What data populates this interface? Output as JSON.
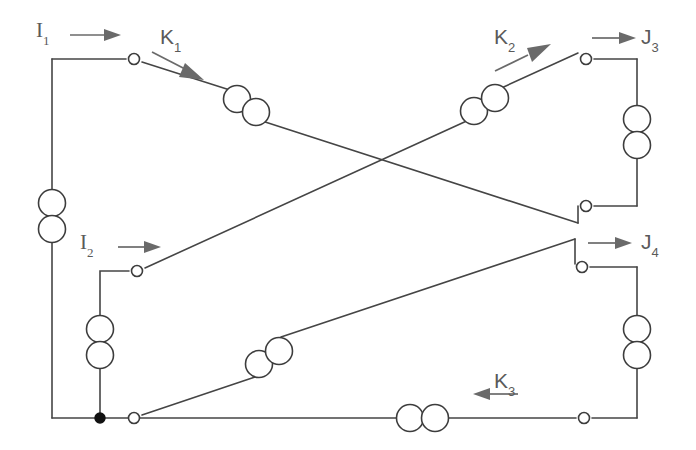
{
  "figure": {
    "kind": "circuit-schematic",
    "width": 696,
    "height": 450,
    "background_color": "#ffffff",
    "wire_color": "#454545",
    "arrow_color": "#6a6a6a",
    "label_color": "#5a5a5a",
    "node_fill_color": "#111111"
  },
  "labels": [
    {
      "id": "I1",
      "base": "I",
      "sub": "1",
      "x": 36,
      "y": 20,
      "style": "serif"
    },
    {
      "id": "K1",
      "base": "K",
      "sub": "1",
      "x": 160,
      "y": 28,
      "style": "sans"
    },
    {
      "id": "K2",
      "base": "K",
      "sub": "2",
      "x": 494,
      "y": 28,
      "style": "sans"
    },
    {
      "id": "J3",
      "base": "J",
      "sub": "3",
      "x": 640,
      "y": 28,
      "style": "sans"
    },
    {
      "id": "I2",
      "base": "I",
      "sub": "2",
      "x": 80,
      "y": 232,
      "style": "serif"
    },
    {
      "id": "J4",
      "base": "J",
      "sub": "4",
      "x": 640,
      "y": 232,
      "style": "sans"
    },
    {
      "id": "K3",
      "base": "K",
      "sub": "3",
      "x": 494,
      "y": 372,
      "style": "sans"
    }
  ],
  "current_arrows": [
    {
      "id": "I1-arrow",
      "direction": "right",
      "x1": 70,
      "y1": 35,
      "x2": 113,
      "y2": 35
    },
    {
      "id": "K1-arrow",
      "direction": "down-right",
      "x1": 152,
      "y1": 52,
      "x2": 202,
      "y2": 78
    },
    {
      "id": "K2-arrow",
      "direction": "up-right",
      "x1": 494,
      "y1": 70,
      "x2": 548,
      "y2": 44
    },
    {
      "id": "J3-arrow",
      "direction": "right",
      "x1": 592,
      "y1": 38,
      "x2": 634,
      "y2": 38
    },
    {
      "id": "I2-arrow",
      "direction": "right",
      "x1": 118,
      "y1": 247,
      "x2": 158,
      "y2": 247
    },
    {
      "id": "J4-arrow",
      "direction": "right",
      "x1": 588,
      "y1": 243,
      "x2": 632,
      "y2": 243
    },
    {
      "id": "K3-arrow",
      "direction": "left",
      "x1": 518,
      "y1": 394,
      "x2": 470,
      "y2": 394
    }
  ],
  "terminals_open": [
    {
      "id": "terminal-I1",
      "x": 134,
      "y": 59
    },
    {
      "id": "terminal-J3",
      "x": 586,
      "y": 59
    },
    {
      "id": "terminal-right-mid",
      "x": 586,
      "y": 206
    },
    {
      "id": "terminal-J4",
      "x": 582,
      "y": 267
    },
    {
      "id": "terminal-I2",
      "x": 137,
      "y": 271
    },
    {
      "id": "terminal-bottom-left",
      "x": 134,
      "y": 418
    },
    {
      "id": "terminal-bottom-right",
      "x": 584,
      "y": 418
    }
  ],
  "terminals_filled": [
    {
      "id": "node-bottom-junction",
      "x": 100,
      "y": 418
    }
  ],
  "coil_pairs": [
    {
      "id": "coil-left-source",
      "orientation": "vertical",
      "cx": 52,
      "cy": 216,
      "r": 14
    },
    {
      "id": "coil-I2-branch",
      "orientation": "vertical",
      "cx": 100,
      "cy": 342,
      "r": 14
    },
    {
      "id": "coil-J3-right",
      "orientation": "vertical",
      "cx": 637,
      "cy": 132,
      "r": 14
    },
    {
      "id": "coil-J4-right",
      "orientation": "vertical",
      "cx": 637,
      "cy": 342,
      "r": 14
    },
    {
      "id": "coil-K1-diagonal",
      "orientation": "diagonal-down",
      "cx": 245,
      "cy": 106,
      "r": 14
    },
    {
      "id": "coil-K2-diagonal",
      "orientation": "diagonal-up",
      "cx": 484,
      "cy": 104,
      "r": 14
    },
    {
      "id": "coil-K-lower-diagonal",
      "orientation": "diagonal-up",
      "cx": 268,
      "cy": 357,
      "r": 14
    },
    {
      "id": "coil-K3-bottom",
      "orientation": "horizontal",
      "cx": 422,
      "cy": 418,
      "r": 14
    }
  ],
  "wires": [
    {
      "id": "wire-I1-top",
      "points": "52,59 134,59"
    },
    {
      "id": "wire-left-vertical",
      "points": "52,59 52,418"
    },
    {
      "id": "wire-K1-diagonal",
      "points": "142,62 586,206"
    },
    {
      "id": "wire-J3-top",
      "points": "594,59 637,59 637,418"
    },
    {
      "id": "wire-right-mid-to-rail",
      "points": "594,206 637,206"
    },
    {
      "id": "wire-I2-branch",
      "points": "129,271 100,271 100,418"
    },
    {
      "id": "wire-I2-diagonal",
      "points": "145,268 586,59"
    },
    {
      "id": "wire-J4-branch",
      "points": "590,267 637,267"
    },
    {
      "id": "wire-bottom-diagonal",
      "points": "142,415 582,267"
    },
    {
      "id": "wire-bottom-rail",
      "points": "52,418 584,418"
    },
    {
      "id": "wire-bottom-right",
      "points": "584,418 637,418"
    }
  ]
}
